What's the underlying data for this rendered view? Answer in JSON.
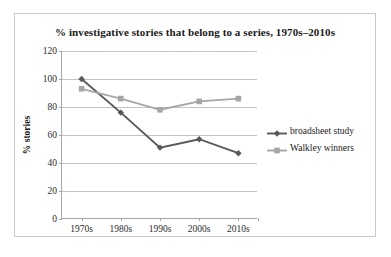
{
  "chart_data": {
    "type": "line",
    "title": "% investigative stories that belong to a series, 1970s–2010s",
    "xlabel": "",
    "ylabel": "% stories",
    "categories": [
      "1970s",
      "1980s",
      "1990s",
      "2000s",
      "2010s"
    ],
    "ylim": [
      0,
      120
    ],
    "ytick_step": 20,
    "yticks": [
      "0",
      "20",
      "40",
      "60",
      "80",
      "100",
      "120"
    ],
    "grid": "horizontal",
    "legend_position": "right",
    "series": [
      {
        "name": "broadsheet study",
        "color": "#595959",
        "marker": "diamond",
        "values": [
          100,
          76,
          51,
          57,
          47
        ]
      },
      {
        "name": "Walkley winners",
        "color": "#a6a6a6",
        "marker": "square",
        "values": [
          93,
          86,
          78,
          84,
          86
        ]
      }
    ]
  },
  "frame": {
    "border_color": "#c9c9c9",
    "background": "#ffffff"
  }
}
